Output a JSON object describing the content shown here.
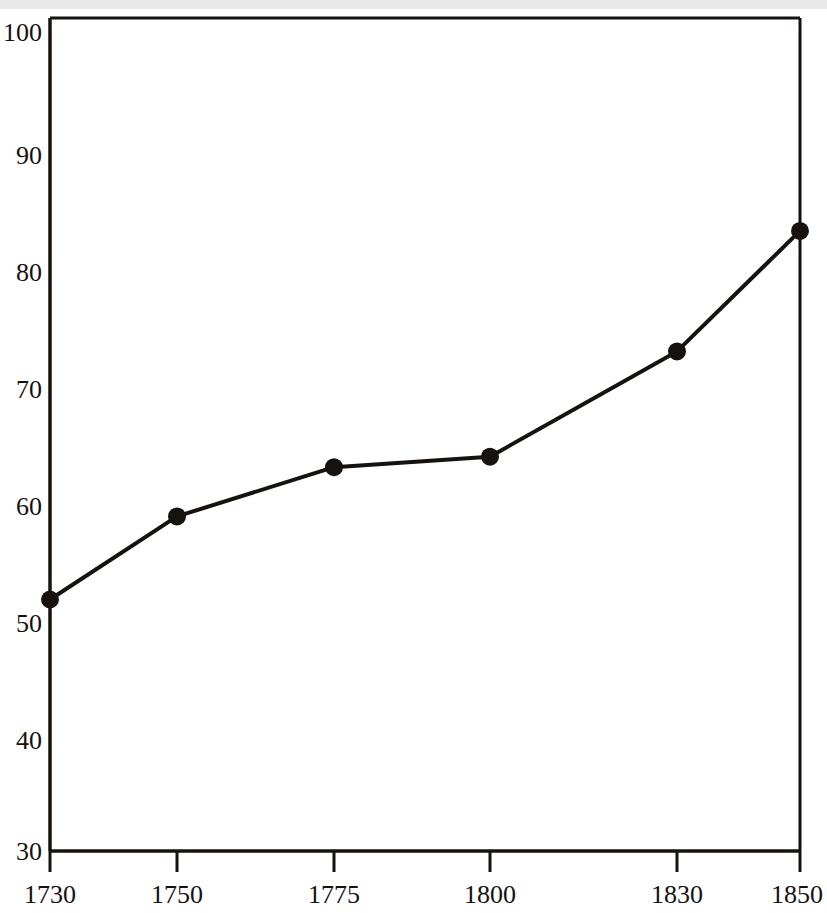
{
  "chart_data": {
    "type": "line",
    "title": "",
    "subtitle": "",
    "xlabel": "",
    "ylabel": "",
    "x": [
      1730,
      1750,
      1775,
      1800,
      1830,
      1850
    ],
    "values": [
      51.5,
      58.6,
      62.8,
      63.7,
      72.7,
      83.0
    ],
    "series": [
      {
        "name": "",
        "x": [
          1730,
          1750,
          1775,
          1800,
          1830,
          1850
        ],
        "values": [
          51.5,
          58.6,
          62.8,
          63.7,
          72.7,
          83.0
        ]
      }
    ],
    "x_tick_labels": [
      "1730",
      "1750",
      "1775",
      "1800",
      "1830",
      "1850"
    ],
    "y_tick_labels": [
      "30",
      "40",
      "50",
      "60",
      "70",
      "80",
      "90",
      "100"
    ],
    "y_ticks": [
      30,
      40,
      50,
      60,
      70,
      80,
      90,
      100
    ],
    "ylim": [
      30,
      100
    ],
    "xlim": [
      1730,
      1850
    ],
    "grid": false,
    "legend": null,
    "marker": "filled-circle",
    "line_color": "#16120f",
    "marker_color": "#16120f",
    "axis_color": "#16120f",
    "background_color": "#ffffff",
    "annotations": []
  },
  "axes": {
    "y_axis_name": "y-axis",
    "x_axis_name": "x-axis"
  }
}
